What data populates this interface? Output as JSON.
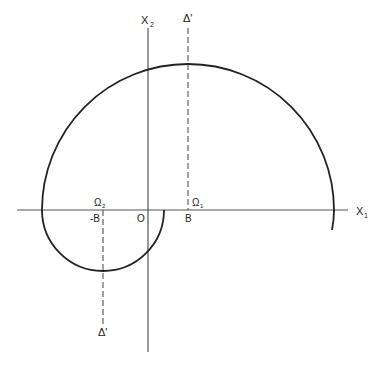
{
  "diagram": {
    "axes": {
      "x1_label": "X",
      "x1_sub": "1",
      "x2_label": "X",
      "x2_sub": "2"
    },
    "lines": {
      "delta_top_label": "Δ'",
      "delta_bottom_label": "Δ'"
    },
    "points": {
      "origin": "O",
      "b_pos": "B",
      "b_neg": "-B",
      "omega1": "Ω",
      "omega1_sub": "1",
      "omega2": "Ω",
      "omega2_sub": "2"
    },
    "colors": {
      "stroke": "#222222",
      "background": "#ffffff"
    }
  }
}
